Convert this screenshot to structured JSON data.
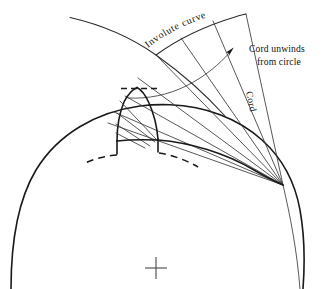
{
  "diagram": {
    "background_color": "#ffffff",
    "line_color": "#1a1a1a",
    "labels": {
      "involute_curve": "Involute  curve",
      "cord_unwinds_line1": "Cord unwinds",
      "cord_unwinds_line2": "from circle",
      "cord": "Cord"
    },
    "icons": {
      "center_mark": "cross-mark-icon",
      "unwind_arrow": "arrow-icon"
    },
    "geometry": {
      "base_circle_center_x": 155,
      "base_circle_center_y": 470,
      "base_circle_radius": 320,
      "outer_arc_radius": 455,
      "cord_origin_x": 283,
      "cord_origin_y": 185,
      "tooth_tip_y": 88,
      "tooth_left_x": 118,
      "tooth_right_x": 158,
      "center_cross_x": 156,
      "center_cross_y": 268,
      "center_cross_size": 11
    }
  }
}
